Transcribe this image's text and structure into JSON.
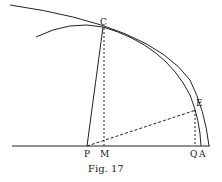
{
  "figure": {
    "caption": "Fig. 17",
    "points": {
      "C": "C",
      "E": "E",
      "P": "P",
      "M": "M",
      "Q": "Q",
      "A": "A"
    },
    "colors": {
      "ink": "#222222",
      "background": "#ffffff"
    }
  }
}
